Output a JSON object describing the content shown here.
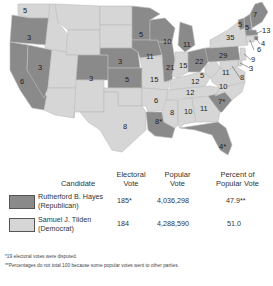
{
  "map": {
    "colors": {
      "republican": "#8a8a8a",
      "democrat": "#d6d6d6",
      "border": "#bdbdbd",
      "water": "#ffffff"
    },
    "state_votes": [
      {
        "state": "WA",
        "votes": "5",
        "party": "democrat"
      },
      {
        "state": "OR",
        "votes": "3",
        "party": "republican"
      },
      {
        "state": "CA",
        "votes": "6",
        "party": "republican"
      },
      {
        "state": "NV",
        "votes": "3",
        "party": "republican"
      },
      {
        "state": "CO",
        "votes": "3",
        "party": "republican"
      },
      {
        "state": "NE",
        "votes": "3",
        "party": "republican"
      },
      {
        "state": "KS",
        "votes": "5",
        "party": "republican"
      },
      {
        "state": "TX",
        "votes": "8",
        "party": "democrat"
      },
      {
        "state": "MN",
        "votes": "5",
        "party": "republican"
      },
      {
        "state": "IA",
        "votes": "11",
        "party": "republican"
      },
      {
        "state": "MO",
        "votes": "15",
        "party": "democrat"
      },
      {
        "state": "AR",
        "votes": "6",
        "party": "democrat"
      },
      {
        "state": "LA",
        "votes": "8*",
        "party": "republican"
      },
      {
        "state": "WI",
        "votes": "10",
        "party": "republican"
      },
      {
        "state": "IL",
        "votes": "21",
        "party": "republican"
      },
      {
        "state": "MI",
        "votes": "11",
        "party": "republican"
      },
      {
        "state": "IN",
        "votes": "15",
        "party": "democrat"
      },
      {
        "state": "OH",
        "votes": "22",
        "party": "republican"
      },
      {
        "state": "KY",
        "votes": "12",
        "party": "democrat"
      },
      {
        "state": "TN",
        "votes": "12",
        "party": "democrat"
      },
      {
        "state": "MS",
        "votes": "8",
        "party": "democrat"
      },
      {
        "state": "AL",
        "votes": "10",
        "party": "democrat"
      },
      {
        "state": "GA",
        "votes": "11",
        "party": "democrat"
      },
      {
        "state": "FL",
        "votes": "4*",
        "party": "republican"
      },
      {
        "state": "SC",
        "votes": "7*",
        "party": "republican"
      },
      {
        "state": "NC",
        "votes": "10",
        "party": "democrat"
      },
      {
        "state": "VA",
        "votes": "11",
        "party": "democrat"
      },
      {
        "state": "WV",
        "votes": "5",
        "party": "democrat"
      },
      {
        "state": "PA",
        "votes": "29",
        "party": "republican"
      },
      {
        "state": "NY",
        "votes": "35",
        "party": "democrat"
      },
      {
        "state": "VT",
        "votes": "5",
        "party": "republican"
      },
      {
        "state": "NH",
        "votes": "5",
        "party": "republican"
      },
      {
        "state": "ME",
        "votes": "7",
        "party": "republican"
      },
      {
        "state": "MA",
        "votes": "13",
        "party": "republican"
      },
      {
        "state": "RI",
        "votes": "4",
        "party": "republican"
      },
      {
        "state": "CT",
        "votes": "6",
        "party": "democrat"
      },
      {
        "state": "NJ",
        "votes": "9",
        "party": "democrat"
      },
      {
        "state": "DE",
        "votes": "3",
        "party": "democrat"
      },
      {
        "state": "MD",
        "votes": "8",
        "party": "democrat"
      }
    ]
  },
  "table": {
    "headers": {
      "candidate": "Candidate",
      "electoral_line1": "Electoral",
      "electoral_line2": "Vote",
      "popular_line1": "Popular",
      "popular_line2": "Vote",
      "percent_line1": "Percent of",
      "percent_line2": "Popular Vote"
    },
    "rows": [
      {
        "name": "Rutherford B. Hayes",
        "party": "(Republican)",
        "electoral": "185*",
        "popular": "4,036,298",
        "percent": "47.9**",
        "color": "#8a8a8a"
      },
      {
        "name": "Samuel J. Tilden",
        "party": "(Democrat)",
        "electoral": "184",
        "popular": "4,288,590",
        "percent": "51.0",
        "color": "#d6d6d6"
      }
    ]
  },
  "footnotes": {
    "note1": "*19 electoral votes were disputed.",
    "note2": "**Percentages do not total 100 because some popular votes went to other parties."
  }
}
